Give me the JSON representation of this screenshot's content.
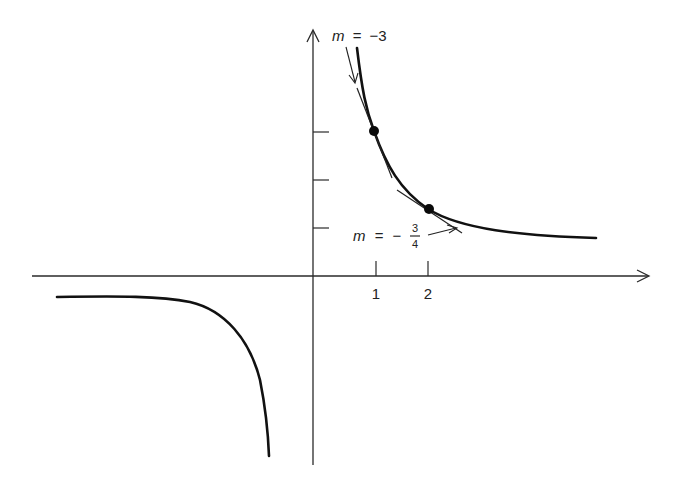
{
  "figure": {
    "x_ticks": [
      {
        "label": "1"
      },
      {
        "label": "2"
      }
    ],
    "y_ticks_count": 3,
    "points": [
      {
        "x": 1,
        "y": 3
      },
      {
        "x": 2,
        "y": 1.5
      }
    ],
    "annotations": {
      "slope1": {
        "var": "m",
        "eq": "=",
        "value": "−3"
      },
      "slope2": {
        "var": "m",
        "eq": "=",
        "sign": "−",
        "numerator": "3",
        "denominator": "4"
      }
    },
    "colors": {
      "curve": "#111111",
      "axis": "#2a2a2a",
      "background": "#ffffff"
    }
  }
}
